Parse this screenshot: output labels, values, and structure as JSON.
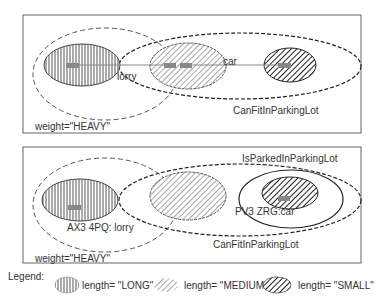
{
  "panel_top": {
    "lorry_label": "lorry",
    "car_label": "car",
    "set_label": "CanFitInParkingLot",
    "weight_label": "weight=\"HEAVY\""
  },
  "panel_bottom": {
    "lorry_label": "AX3 4PQ: lorry",
    "car_label": "PV3 ZRG:car",
    "parked_label": "IsParkedInParkingLot",
    "set_label": "CanFitInParkingLot",
    "weight_label": "weight=\"HEAVY\""
  },
  "legend": {
    "title": "Legend:",
    "items": [
      {
        "pattern": "vertical-stripes",
        "label": "length= \"LONG\""
      },
      {
        "pattern": "diagonal-light",
        "label": "length= \"MEDIUM\""
      },
      {
        "pattern": "diagonal-dense",
        "label": "length= \"SMALL\""
      }
    ]
  },
  "colors": {
    "stroke": "#333333",
    "box": "#666666",
    "marker": "#888888"
  }
}
